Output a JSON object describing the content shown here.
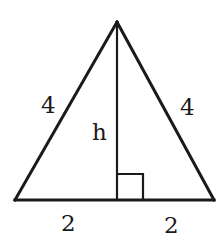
{
  "diagram": {
    "type": "isosceles-triangle-with-altitude",
    "labels": {
      "left_side": "4",
      "right_side": "4",
      "height": "h",
      "base_left_half": "2",
      "base_right_half": "2"
    },
    "right_angle_marker": true,
    "colors": {
      "stroke": "#1a1a1a",
      "background": "#ffffff"
    }
  }
}
